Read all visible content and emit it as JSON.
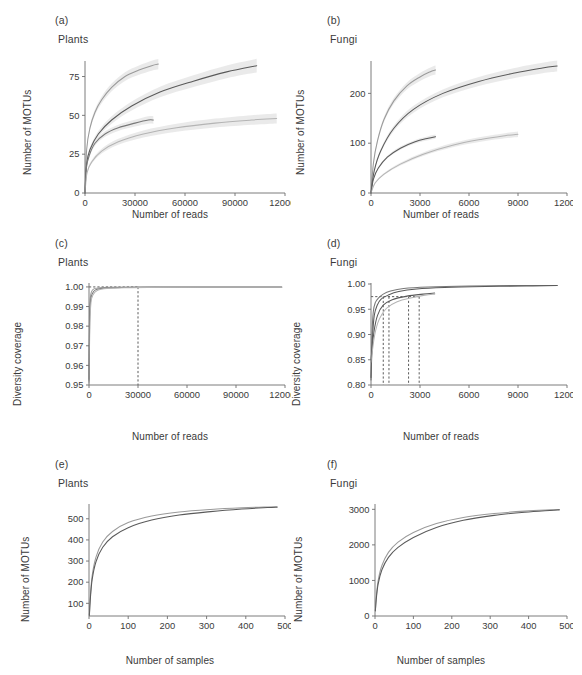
{
  "figure": {
    "width": 582,
    "height": 675,
    "background": "#ffffff",
    "line_colors": [
      "#5a5a5a",
      "#787878",
      "#9a9a9a",
      "#b4b4b4"
    ],
    "ribbon_color": "#d9d9d9",
    "axis_color": "#6e6e6e",
    "dashed_color": "#4a4a4a"
  },
  "panels": [
    {
      "tag": "(a)",
      "title": "Plants",
      "xlabel": "Number of reads",
      "ylabel": "Number of MOTUs",
      "xticks": [
        "0",
        "30000",
        "60000",
        "90000",
        "120000"
      ],
      "yticks": [
        "0",
        "25",
        "50",
        "75"
      ]
    },
    {
      "tag": "(b)",
      "title": "Fungi",
      "xlabel": "Number of reads",
      "ylabel": "Number of MOTUs",
      "xticks": [
        "0",
        "3000",
        "6000",
        "9000",
        "12000"
      ],
      "yticks": [
        "0",
        "100",
        "200"
      ]
    },
    {
      "tag": "(c)",
      "title": "Plants",
      "xlabel": "Number of reads",
      "ylabel": "Diversity coverage",
      "xticks": [
        "0",
        "30000",
        "60000",
        "90000",
        "120000"
      ],
      "yticks": [
        "0.95",
        "0.96",
        "0.97",
        "0.98",
        "0.99",
        "1.00"
      ]
    },
    {
      "tag": "(d)",
      "title": "Fungi",
      "xlabel": "Number of reads",
      "ylabel": "Diversity coverage",
      "xticks": [
        "0",
        "3000",
        "6000",
        "9000",
        "12000"
      ],
      "yticks": [
        "0.80",
        "0.85",
        "0.90",
        "0.95",
        "1.00"
      ]
    },
    {
      "tag": "(e)",
      "title": "Plants",
      "xlabel": "Number of samples",
      "ylabel": "Number of MOTUs",
      "xticks": [
        "0",
        "100",
        "200",
        "300",
        "400",
        "500"
      ],
      "yticks": [
        "100",
        "200",
        "300",
        "400",
        "500"
      ]
    },
    {
      "tag": "(f)",
      "title": "Fungi",
      "xlabel": "Number of samples",
      "ylabel": "Number of MOTUs",
      "xticks": [
        "0",
        "100",
        "200",
        "300",
        "400",
        "500"
      ],
      "yticks": [
        "0",
        "1000",
        "2000",
        "3000"
      ]
    }
  ],
  "chart_data": [
    {
      "id": "a",
      "type": "line",
      "title": "Plants",
      "panel_tag": "(a)",
      "xlabel": "Number of reads",
      "ylabel": "Number of MOTUs",
      "xlim": [
        0,
        120000
      ],
      "ylim": [
        0,
        85
      ],
      "xticks": [
        0,
        30000,
        60000,
        90000,
        120000
      ],
      "yticks": [
        0,
        25,
        50,
        75
      ],
      "grid": false,
      "legend": "none",
      "ribbons": true,
      "series": [
        {
          "name": "curve-1",
          "color": "#9a9a9a",
          "x": [
            0,
            1000,
            3000,
            6000,
            10000,
            16000,
            24000,
            32000,
            40000,
            44000
          ],
          "y": [
            0,
            28,
            42,
            52,
            60,
            68,
            75,
            79,
            82,
            83
          ],
          "ribbon_halfwidth": [
            0,
            1.2,
            1.6,
            1.9,
            2.2,
            2.5,
            2.8,
            3.0,
            3.2,
            3.3
          ]
        },
        {
          "name": "curve-2",
          "color": "#5a5a5a",
          "x": [
            0,
            1000,
            3000,
            8000,
            16000,
            28000,
            45000,
            65000,
            85000,
            103000
          ],
          "y": [
            0,
            19,
            28,
            38,
            47,
            56,
            65,
            72,
            78,
            82
          ],
          "ribbon_halfwidth": [
            0,
            1.0,
            1.4,
            1.9,
            2.4,
            2.9,
            3.4,
            3.8,
            4.1,
            4.4
          ]
        },
        {
          "name": "curve-3",
          "color": "#787878",
          "x": [
            0,
            800,
            2500,
            6000,
            12000,
            20000,
            30000,
            38000,
            41000
          ],
          "y": [
            0,
            16,
            24,
            32,
            38,
            42,
            45,
            47,
            47
          ],
          "ribbon_halfwidth": [
            0,
            0.9,
            1.2,
            1.5,
            1.8,
            2.0,
            2.2,
            2.4,
            2.5
          ]
        },
        {
          "name": "curve-4",
          "color": "#b4b4b4",
          "x": [
            0,
            1200,
            4000,
            10000,
            20000,
            35000,
            55000,
            78000,
            100000,
            115000
          ],
          "y": [
            0,
            13,
            20,
            27,
            33,
            38,
            42,
            45,
            47,
            48
          ],
          "ribbon_halfwidth": [
            0,
            0.8,
            1.1,
            1.5,
            1.9,
            2.3,
            2.6,
            2.9,
            3.1,
            3.2
          ]
        }
      ]
    },
    {
      "id": "b",
      "type": "line",
      "title": "Fungi",
      "panel_tag": "(b)",
      "xlabel": "Number of reads",
      "ylabel": "Number of MOTUs",
      "xlim": [
        0,
        12000
      ],
      "ylim": [
        0,
        265
      ],
      "xticks": [
        0,
        3000,
        6000,
        9000,
        12000
      ],
      "yticks": [
        0,
        100,
        200
      ],
      "grid": false,
      "legend": "none",
      "ribbons": true,
      "series": [
        {
          "name": "curve-1",
          "color": "#9a9a9a",
          "x": [
            0,
            150,
            400,
            800,
            1400,
            2200,
            3000,
            3600,
            3950
          ],
          "y": [
            0,
            60,
            105,
            148,
            185,
            215,
            233,
            243,
            247
          ],
          "ribbon_halfwidth": [
            0,
            3,
            4,
            5,
            6,
            7,
            8,
            8.5,
            9
          ]
        },
        {
          "name": "curve-2",
          "color": "#5a5a5a",
          "x": [
            0,
            200,
            600,
            1400,
            2600,
            4400,
            6600,
            8800,
            10500,
            11400
          ],
          "y": [
            0,
            45,
            85,
            130,
            168,
            200,
            224,
            241,
            251,
            255
          ],
          "ribbon_halfwidth": [
            0,
            3,
            4,
            5.5,
            7,
            8,
            9,
            10,
            10.5,
            11
          ]
        },
        {
          "name": "curve-3",
          "color": "#5a5a5a",
          "x": [
            0,
            150,
            450,
            1000,
            1800,
            2700,
            3500,
            3950
          ],
          "y": [
            0,
            28,
            50,
            72,
            90,
            103,
            110,
            113
          ],
          "ribbon_halfwidth": [
            0,
            1.5,
            2,
            2.6,
            3.2,
            3.6,
            4,
            4.2
          ]
        },
        {
          "name": "curve-4",
          "color": "#b4b4b4",
          "x": [
            0,
            250,
            800,
            1800,
            3200,
            5000,
            6800,
            8200,
            9000
          ],
          "y": [
            0,
            20,
            38,
            58,
            78,
            96,
            108,
            115,
            118
          ],
          "ribbon_halfwidth": [
            0,
            1.5,
            2,
            2.8,
            3.5,
            4.2,
            4.8,
            5.2,
            5.5
          ]
        }
      ]
    },
    {
      "id": "c",
      "type": "line",
      "title": "Plants",
      "panel_tag": "(c)",
      "xlabel": "Number of reads",
      "ylabel": "Diversity coverage",
      "xlim": [
        0,
        120000
      ],
      "ylim": [
        0.95,
        1.002
      ],
      "xticks": [
        0,
        30000,
        60000,
        90000,
        120000
      ],
      "yticks": [
        0.95,
        0.96,
        0.97,
        0.98,
        0.99,
        1.0
      ],
      "grid": false,
      "legend": "none",
      "reference_lines": {
        "horizontal_y": 1.0,
        "vertical_x": [
          30000
        ],
        "style": "dashed"
      },
      "series": [
        {
          "name": "curve-1",
          "color": "#9a9a9a",
          "x": [
            0,
            300,
            800,
            1500,
            3000,
            6000,
            12000,
            30000,
            60000,
            90000,
            118000
          ],
          "y": [
            0.952,
            0.985,
            0.9945,
            0.9975,
            0.999,
            0.9995,
            0.9998,
            0.99995,
            1.0,
            1.0,
            1.0
          ]
        },
        {
          "name": "curve-2",
          "color": "#787878",
          "x": [
            0,
            400,
            1000,
            2000,
            4000,
            9000,
            20000,
            40000,
            70000,
            100000,
            118000
          ],
          "y": [
            0.953,
            0.982,
            0.993,
            0.9965,
            0.9985,
            0.9993,
            0.9997,
            0.99993,
            1.0,
            1.0,
            1.0
          ]
        },
        {
          "name": "curve-3",
          "color": "#b4b4b4",
          "x": [
            0,
            500,
            1200,
            2500,
            5000,
            11000,
            25000,
            45000,
            80000,
            118000
          ],
          "y": [
            0.951,
            0.98,
            0.992,
            0.996,
            0.9982,
            0.9992,
            0.9996,
            0.9999,
            1.0,
            1.0
          ]
        }
      ]
    },
    {
      "id": "d",
      "type": "line",
      "title": "Fungi",
      "panel_tag": "(d)",
      "xlabel": "Number of reads",
      "ylabel": "Diversity coverage",
      "xlim": [
        0,
        12000
      ],
      "ylim": [
        0.8,
        1.002
      ],
      "xticks": [
        0,
        3000,
        6000,
        9000,
        12000
      ],
      "yticks": [
        0.8,
        0.85,
        0.9,
        0.95,
        1.0
      ],
      "grid": false,
      "legend": "none",
      "reference_lines": {
        "horizontal_y": 0.975,
        "vertical_x": [
          750,
          1100,
          2300,
          2950
        ],
        "style": "dashed"
      },
      "series": [
        {
          "name": "curve-1",
          "color": "#787878",
          "x": [
            0,
            60,
            140,
            260,
            450,
            750,
            1200,
            2000,
            3500,
            6000,
            9000,
            11400
          ],
          "y": [
            0.81,
            0.9,
            0.945,
            0.963,
            0.972,
            0.98,
            0.986,
            0.991,
            0.994,
            0.996,
            0.997,
            0.997
          ]
        },
        {
          "name": "curve-2",
          "color": "#5a5a5a",
          "x": [
            0,
            90,
            200,
            380,
            620,
            1050,
            1700,
            2800,
            4500,
            7000,
            9500,
            11400
          ],
          "y": [
            0.815,
            0.893,
            0.938,
            0.958,
            0.97,
            0.978,
            0.985,
            0.99,
            0.993,
            0.995,
            0.996,
            0.997
          ]
        },
        {
          "name": "curve-3",
          "color": "#5a5a5a",
          "x": [
            0,
            180,
            400,
            750,
            1300,
            2200,
            3200,
            3900
          ],
          "y": [
            0.85,
            0.905,
            0.938,
            0.958,
            0.969,
            0.976,
            0.98,
            0.982
          ]
        },
        {
          "name": "curve-4",
          "color": "#b4b4b4",
          "x": [
            0,
            220,
            500,
            950,
            1600,
            2500,
            3300,
            3900
          ],
          "y": [
            0.845,
            0.898,
            0.93,
            0.952,
            0.965,
            0.973,
            0.978,
            0.98
          ]
        }
      ]
    },
    {
      "id": "e",
      "type": "line",
      "title": "Plants",
      "panel_tag": "(e)",
      "xlabel": "Number of samples",
      "ylabel": "Number of MOTUs",
      "xlim": [
        0,
        500
      ],
      "ylim": [
        40,
        570
      ],
      "xticks": [
        0,
        100,
        200,
        300,
        400,
        500
      ],
      "yticks": [
        100,
        200,
        300,
        400,
        500
      ],
      "grid": false,
      "legend": "none",
      "series": [
        {
          "name": "curve-1",
          "color": "#9a9a9a",
          "x": [
            1,
            3,
            8,
            18,
            35,
            60,
            100,
            160,
            230,
            310,
            390,
            455,
            480
          ],
          "y": [
            45,
            120,
            230,
            320,
            390,
            440,
            482,
            513,
            532,
            544,
            552,
            556,
            557
          ]
        },
        {
          "name": "curve-2",
          "color": "#5a5a5a",
          "x": [
            1,
            3,
            8,
            18,
            35,
            60,
            100,
            160,
            230,
            310,
            390,
            455,
            480
          ],
          "y": [
            42,
            110,
            212,
            298,
            365,
            415,
            458,
            494,
            518,
            534,
            546,
            553,
            555
          ]
        }
      ]
    },
    {
      "id": "f",
      "type": "line",
      "title": "Fungi",
      "panel_tag": "(f)",
      "xlabel": "Number of samples",
      "ylabel": "Number of MOTUs",
      "xlim": [
        0,
        500
      ],
      "ylim": [
        0,
        3150
      ],
      "xticks": [
        0,
        100,
        200,
        300,
        400,
        500
      ],
      "yticks": [
        0,
        1000,
        2000,
        3000
      ],
      "grid": false,
      "legend": "none",
      "series": [
        {
          "name": "curve-1",
          "color": "#9a9a9a",
          "x": [
            1,
            3,
            8,
            18,
            35,
            60,
            100,
            160,
            230,
            310,
            390,
            455,
            480
          ],
          "y": [
            150,
            480,
            980,
            1420,
            1790,
            2080,
            2350,
            2600,
            2770,
            2880,
            2950,
            2985,
            2995
          ]
        },
        {
          "name": "curve-2",
          "color": "#5a5a5a",
          "x": [
            1,
            3,
            8,
            18,
            35,
            60,
            100,
            160,
            230,
            310,
            390,
            455,
            480
          ],
          "y": [
            140,
            440,
            890,
            1300,
            1650,
            1930,
            2210,
            2490,
            2690,
            2830,
            2920,
            2970,
            2985
          ]
        }
      ]
    }
  ]
}
